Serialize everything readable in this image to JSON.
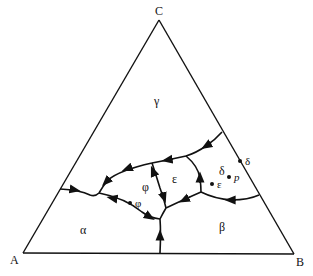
{
  "diagram": {
    "type": "ternary-phase-diagram",
    "vertices": {
      "top": "C",
      "left": "A",
      "right": "B"
    },
    "regions": [
      {
        "id": "alpha",
        "label": "α"
      },
      {
        "id": "beta",
        "label": "β"
      },
      {
        "id": "gamma",
        "label": "γ"
      },
      {
        "id": "delta",
        "label": "δ"
      },
      {
        "id": "epsilon",
        "label": "ε"
      },
      {
        "id": "phi",
        "label": "φ"
      }
    ],
    "points": [
      {
        "id": "phi-point",
        "label": "φ"
      },
      {
        "id": "epsilon-point",
        "label": "ε"
      },
      {
        "id": "p-point",
        "label": "p"
      },
      {
        "id": "delta-edge-point",
        "label": "δ"
      }
    ],
    "colors": {
      "line": "#111111",
      "background": "#ffffff"
    }
  }
}
